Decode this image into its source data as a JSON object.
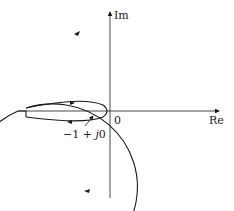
{
  "diagram": {
    "type": "nyquist-plot",
    "axes": {
      "x_label": "Re",
      "y_label": "Im",
      "origin_label": "0"
    },
    "annotations": {
      "critical_point_prefix": "−1 + ",
      "critical_point_j": "j",
      "critical_point_suffix": "0"
    },
    "colors": {
      "line": "#1a1a1a",
      "background": "#ffffff"
    }
  }
}
